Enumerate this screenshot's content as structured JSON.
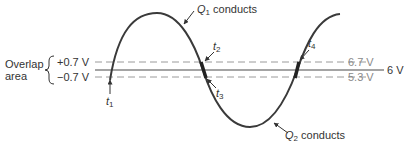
{
  "diagram": {
    "overlap_label_line1": "Overlap",
    "overlap_label_line2": "area",
    "plus_label": "+0.7 V",
    "minus_label": "−0.7 V",
    "upper_level_label": "6.7 V",
    "center_level_label": "6 V",
    "lower_level_label": "5.3 V",
    "q1_label": {
      "letter": "Q",
      "sub": "1",
      "text": " conducts"
    },
    "q2_label": {
      "letter": "Q",
      "sub": "2",
      "text": " conducts"
    },
    "time_markers": [
      {
        "letter": "t",
        "sub": "1"
      },
      {
        "letter": "t",
        "sub": "2"
      },
      {
        "letter": "t",
        "sub": "3"
      },
      {
        "letter": "t",
        "sub": "4"
      }
    ],
    "colors": {
      "curve": "#3a3a3a",
      "solid_line": "#4a4a4a",
      "dashed_line": "#9a9a9a",
      "grey_text": "#8a8a8a",
      "text": "#333333"
    }
  }
}
